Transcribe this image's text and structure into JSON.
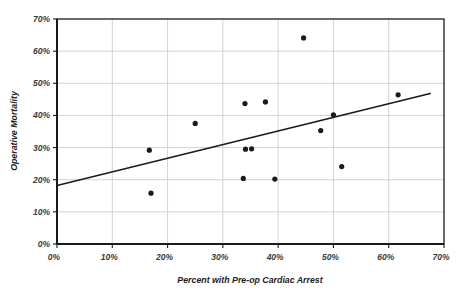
{
  "chart_data": {
    "type": "scatter",
    "title": "",
    "xlabel": "Percent with Pre-op Cardiac Arrest",
    "ylabel": "Operative Mortality",
    "xlim": [
      0,
      70
    ],
    "ylim": [
      0,
      70
    ],
    "xticks": [
      "0%",
      "10%",
      "20%",
      "30%",
      "40%",
      "50%",
      "60%",
      "70%"
    ],
    "xtick_values": [
      0,
      10,
      20,
      30,
      40,
      50,
      60,
      70
    ],
    "yticks": [
      "0%",
      "10%",
      "20%",
      "30%",
      "40%",
      "50%",
      "60%",
      "70%"
    ],
    "ytick_values": [
      0,
      10,
      20,
      30,
      40,
      50,
      60,
      70
    ],
    "grid": "horizontal",
    "legend": "none",
    "marker_color": "#1a1a1a",
    "marker_shape": "circle",
    "marker_size": 5.2,
    "axis_color": "#1a1a1a",
    "grid_color": "#c8c8c8",
    "points": [
      {
        "x": 16.7,
        "y": 29.2
      },
      {
        "x": 17.0,
        "y": 15.8
      },
      {
        "x": 25.0,
        "y": 37.5
      },
      {
        "x": 33.7,
        "y": 20.4
      },
      {
        "x": 34.0,
        "y": 43.7
      },
      {
        "x": 34.1,
        "y": 29.5
      },
      {
        "x": 35.2,
        "y": 29.6
      },
      {
        "x": 37.7,
        "y": 44.2
      },
      {
        "x": 39.4,
        "y": 20.2
      },
      {
        "x": 44.6,
        "y": 64.1
      },
      {
        "x": 47.7,
        "y": 35.3
      },
      {
        "x": 50.0,
        "y": 40.2
      },
      {
        "x": 51.5,
        "y": 24.1
      },
      {
        "x": 61.7,
        "y": 46.4
      }
    ],
    "trendline": {
      "type": "linear",
      "x_start": 0,
      "y_start": 18.2,
      "x_end": 67.5,
      "y_end": 46.8,
      "color": "#1a1a1a",
      "width": 1.6
    }
  }
}
